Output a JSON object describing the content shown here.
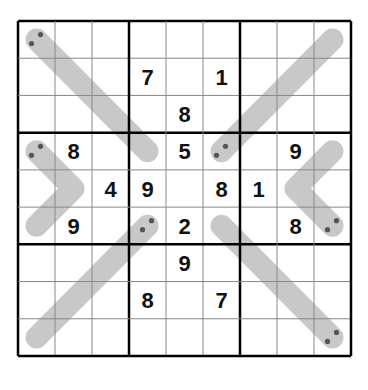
{
  "puzzle": {
    "type": "Sudoku with thermometer-like lines",
    "grid_size": 9,
    "givens": [
      [
        0,
        0,
        0,
        0,
        0,
        0,
        0,
        0,
        0
      ],
      [
        0,
        0,
        0,
        7,
        0,
        1,
        0,
        0,
        0
      ],
      [
        0,
        0,
        0,
        0,
        8,
        0,
        0,
        0,
        0
      ],
      [
        0,
        8,
        0,
        0,
        5,
        0,
        0,
        9,
        0
      ],
      [
        0,
        0,
        4,
        9,
        0,
        8,
        1,
        0,
        0
      ],
      [
        0,
        9,
        0,
        0,
        2,
        0,
        0,
        8,
        0
      ],
      [
        0,
        0,
        0,
        0,
        9,
        0,
        0,
        0,
        0
      ],
      [
        0,
        0,
        0,
        8,
        0,
        7,
        0,
        0,
        0
      ],
      [
        0,
        0,
        0,
        0,
        0,
        0,
        0,
        0,
        0
      ]
    ],
    "lines": [
      {
        "name": "line-top-left-diagonal",
        "cells": [
          [
            0,
            0
          ],
          [
            1,
            1
          ],
          [
            2,
            2
          ],
          [
            3,
            3
          ]
        ],
        "dots_at": [
          0,
          0
        ]
      },
      {
        "name": "line-top-right-diagonal",
        "cells": [
          [
            0,
            8
          ],
          [
            1,
            7
          ],
          [
            2,
            6
          ],
          [
            3,
            5
          ]
        ],
        "dots_at": [
          3,
          5
        ]
      },
      {
        "name": "line-left-chevron",
        "cells": [
          [
            3,
            0
          ],
          [
            4,
            1
          ],
          [
            5,
            0
          ]
        ],
        "dots_at": [
          3,
          0
        ]
      },
      {
        "name": "line-right-chevron",
        "cells": [
          [
            3,
            8
          ],
          [
            4,
            7
          ],
          [
            5,
            8
          ]
        ],
        "dots_at": [
          5,
          8
        ]
      },
      {
        "name": "line-bottom-left-diagonal",
        "cells": [
          [
            8,
            0
          ],
          [
            7,
            1
          ],
          [
            6,
            2
          ],
          [
            5,
            3
          ]
        ],
        "dots_at": [
          5,
          3
        ]
      },
      {
        "name": "line-bottom-right-diagonal",
        "cells": [
          [
            5,
            5
          ],
          [
            6,
            6
          ],
          [
            7,
            7
          ],
          [
            8,
            8
          ]
        ],
        "dots_at": [
          8,
          8
        ]
      }
    ],
    "colors": {
      "line": "#c8c8c8",
      "dot": "#555555",
      "grid_thin": "#888888",
      "grid_thick": "#000000",
      "digit": "#111111"
    }
  }
}
